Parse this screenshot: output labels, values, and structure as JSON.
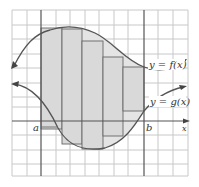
{
  "figure": {
    "type": "area-between-curves-riemann",
    "curves": {
      "f": {
        "label": "y = f(x)"
      },
      "g": {
        "label": "y = g(x)"
      }
    },
    "axis_labels": {
      "x": "x"
    },
    "interval": {
      "a": "a",
      "b": "b"
    },
    "rectangles": [
      {
        "x0": 41,
        "x1": 62,
        "top": 28,
        "bottom": 129
      },
      {
        "x0": 62,
        "x1": 82,
        "top": 29,
        "bottom": 144
      },
      {
        "x0": 82,
        "x1": 103,
        "top": 41,
        "bottom": 149
      },
      {
        "x0": 103,
        "x1": 123,
        "top": 57,
        "bottom": 136
      },
      {
        "x0": 123,
        "x1": 144,
        "top": 67,
        "bottom": 111
      }
    ],
    "colors": {
      "grid": "#c8c8c8",
      "axis": "#555555",
      "curve": "#555555",
      "fill": "#dcdcdc",
      "rect_stroke": "#666666"
    }
  }
}
